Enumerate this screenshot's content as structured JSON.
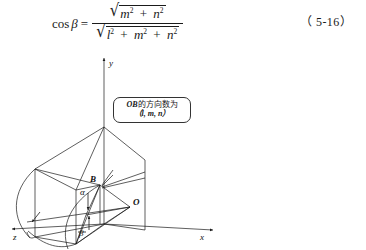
{
  "formula": {
    "lhs": "cos",
    "lhs_var": "β",
    "equals": "=",
    "numerator": {
      "terms": [
        "m",
        "n"
      ],
      "exponent": "2",
      "plus": "+",
      "radical": "√"
    },
    "denominator": {
      "terms": [
        "l",
        "m",
        "n"
      ],
      "exponent": "2",
      "plus": "+",
      "radical": "√"
    },
    "full_text": "cos β = √(m² + n²) / √(l² + m² + n²)"
  },
  "equation_number": "（ 5-16）",
  "diagram": {
    "axes": {
      "x_label": "x",
      "y_label": "y",
      "z_label": "z"
    },
    "points": {
      "origin": "O",
      "vector_tip": "B"
    },
    "angles": {
      "alpha": "α",
      "beta": "β"
    },
    "callout": {
      "line1_lead": "OB",
      "line1_rest": "的方向数为",
      "line2": "（l, m, n）"
    },
    "colors": {
      "stroke": "#1a1a1a",
      "background": "#ffffff"
    }
  }
}
